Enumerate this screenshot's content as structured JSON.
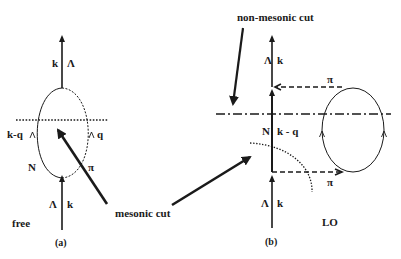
{
  "panel_a": {
    "caption": "(a)",
    "tag": "free",
    "labels": {
      "k_top": "k",
      "lambda_top": "Λ",
      "kq": "k-q",
      "q": "q",
      "N": "N",
      "pi": "π",
      "lambda_bottom": "Λ",
      "k_bottom": "k"
    }
  },
  "panel_b": {
    "caption": "(b)",
    "tag": "LO",
    "labels": {
      "lambda_top": "Λ",
      "k_top": "k",
      "pi_top": "π",
      "N": "N",
      "kq": "k - q",
      "pi_bottom": "π",
      "lambda_bottom": "Λ",
      "k_bottom": "k"
    }
  },
  "annotations": {
    "mesonic_cut": "mesonic cut",
    "non_mesonic_cut": "non-mesonic cut"
  },
  "colors": {
    "ink": "#1a1a1a",
    "background": "#ffffff"
  }
}
